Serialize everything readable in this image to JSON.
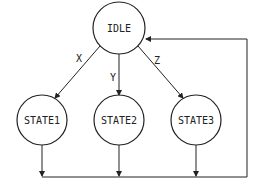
{
  "diagram": {
    "type": "state-machine",
    "nodes": [
      {
        "id": "idle",
        "label": "IDLE"
      },
      {
        "id": "state1",
        "label": "STATE1"
      },
      {
        "id": "state2",
        "label": "STATE2"
      },
      {
        "id": "state3",
        "label": "STATE3"
      }
    ],
    "edges": [
      {
        "from": "IDLE",
        "to": "STATE1",
        "label": "X"
      },
      {
        "from": "IDLE",
        "to": "STATE2",
        "label": "Y"
      },
      {
        "from": "IDLE",
        "to": "STATE3",
        "label": "Z"
      },
      {
        "from": "STATE1",
        "to": "IDLE",
        "label": ""
      },
      {
        "from": "STATE2",
        "to": "IDLE",
        "label": ""
      },
      {
        "from": "STATE3",
        "to": "IDLE",
        "label": ""
      }
    ],
    "colors": {
      "stroke": "#222222",
      "background": "#ffffff"
    }
  }
}
